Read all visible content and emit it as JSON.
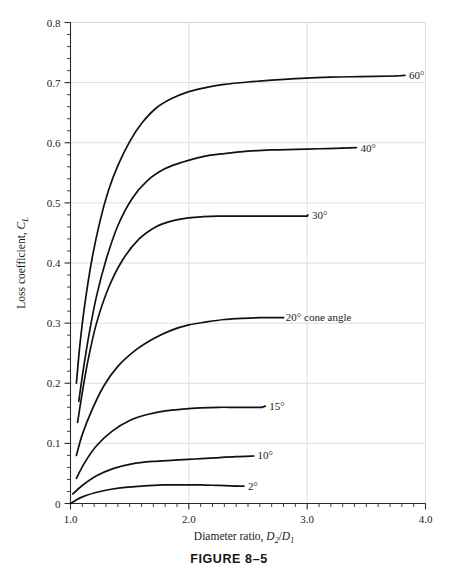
{
  "figure": {
    "caption": "FIGURE 8–5"
  },
  "chart_data": {
    "type": "line",
    "title": "",
    "xlabel_parts": {
      "text": "Diameter ratio, ",
      "d": "D",
      "sub2": "2",
      "slash": "/",
      "d1": "D",
      "sub1": "1"
    },
    "ylabel_parts": {
      "text": "Loss coefficient, ",
      "c": "C",
      "subL": "L"
    },
    "xlim": [
      1.0,
      4.0
    ],
    "ylim": [
      0.0,
      0.8
    ],
    "grid": true,
    "legend_position": "right-inline-labels",
    "x_tick_labels": [
      "1.0",
      "2.0",
      "3.0",
      "4.0"
    ],
    "x_tick_values": [
      1.0,
      2.0,
      3.0,
      4.0
    ],
    "x_minor_step": 0.1,
    "y_tick_labels": [
      "0",
      "0.1",
      "0.2",
      "0.3",
      "0.4",
      "0.5",
      "0.6",
      "0.7",
      "0.8"
    ],
    "y_tick_values": [
      0,
      0.1,
      0.2,
      0.3,
      0.4,
      0.5,
      0.6,
      0.7,
      0.8
    ],
    "y_minor_step": 0.02,
    "series": [
      {
        "name": "60°",
        "label": "60°",
        "label_x": 3.86,
        "label_y": 0.712,
        "leader_from_x": 3.52,
        "x": [
          1.05,
          1.08,
          1.12,
          1.18,
          1.25,
          1.32,
          1.4,
          1.5,
          1.6,
          1.72,
          1.85,
          2.0,
          2.15,
          2.3,
          2.5,
          2.7,
          2.95,
          3.2,
          3.45,
          3.75
        ],
        "y": [
          0.2,
          0.265,
          0.33,
          0.405,
          0.47,
          0.52,
          0.562,
          0.602,
          0.632,
          0.657,
          0.673,
          0.685,
          0.692,
          0.697,
          0.701,
          0.704,
          0.707,
          0.709,
          0.71,
          0.711
        ]
      },
      {
        "name": "40°",
        "label": "40°",
        "label_x": 3.45,
        "label_y": 0.592,
        "leader_from_x": 3.22,
        "x": [
          1.07,
          1.11,
          1.16,
          1.22,
          1.3,
          1.4,
          1.52,
          1.65,
          1.8,
          1.95,
          2.12,
          2.3,
          2.5,
          2.7,
          2.9,
          3.1,
          3.3
        ],
        "y": [
          0.17,
          0.225,
          0.285,
          0.345,
          0.405,
          0.462,
          0.507,
          0.537,
          0.557,
          0.568,
          0.577,
          0.582,
          0.586,
          0.588,
          0.589,
          0.59,
          0.591
        ]
      },
      {
        "name": "30°",
        "label": "30°",
        "label_x": 3.04,
        "label_y": 0.48,
        "leader_from_x": 2.78,
        "x": [
          1.06,
          1.1,
          1.15,
          1.22,
          1.32,
          1.44,
          1.58,
          1.72,
          1.86,
          2.0,
          2.12,
          2.25,
          2.4,
          2.6,
          2.8,
          3.0
        ],
        "y": [
          0.135,
          0.185,
          0.24,
          0.3,
          0.358,
          0.405,
          0.44,
          0.46,
          0.47,
          0.475,
          0.477,
          0.478,
          0.478,
          0.478,
          0.478,
          0.478
        ]
      },
      {
        "name": "20° cone angle",
        "label": "20° cone angle",
        "label_x": 2.82,
        "label_y": 0.31,
        "leader_from_x": 2.6,
        "x": [
          1.05,
          1.1,
          1.18,
          1.28,
          1.4,
          1.55,
          1.7,
          1.85,
          2.0,
          2.15,
          2.3,
          2.45,
          2.6,
          2.8
        ],
        "y": [
          0.08,
          0.115,
          0.155,
          0.195,
          0.228,
          0.255,
          0.274,
          0.288,
          0.297,
          0.302,
          0.306,
          0.308,
          0.309,
          0.309
        ]
      },
      {
        "name": "15°",
        "label": "15°",
        "label_x": 2.68,
        "label_y": 0.162,
        "leader_from_x": 2.44,
        "x": [
          1.05,
          1.12,
          1.22,
          1.35,
          1.5,
          1.65,
          1.8,
          1.95,
          2.1,
          2.25,
          2.4,
          2.62
        ],
        "y": [
          0.042,
          0.068,
          0.096,
          0.12,
          0.138,
          0.148,
          0.154,
          0.157,
          0.159,
          0.16,
          0.16,
          0.16
        ]
      },
      {
        "name": "10°",
        "label": "10°",
        "label_x": 2.58,
        "label_y": 0.08,
        "leader_from_x": 2.38,
        "x": [
          1.02,
          1.1,
          1.22,
          1.36,
          1.52,
          1.7,
          1.88,
          2.05,
          2.22,
          2.4,
          2.55
        ],
        "y": [
          0.016,
          0.03,
          0.046,
          0.058,
          0.066,
          0.07,
          0.072,
          0.074,
          0.076,
          0.078,
          0.079
        ]
      },
      {
        "name": "2°",
        "label": "2°",
        "label_x": 2.5,
        "label_y": 0.029,
        "leader_from_x": 2.32,
        "x": [
          1.0,
          1.1,
          1.25,
          1.42,
          1.6,
          1.78,
          1.95,
          2.1,
          2.25,
          2.4
        ],
        "y": [
          0.0,
          0.011,
          0.02,
          0.026,
          0.029,
          0.031,
          0.031,
          0.031,
          0.03,
          0.029
        ]
      }
    ]
  }
}
